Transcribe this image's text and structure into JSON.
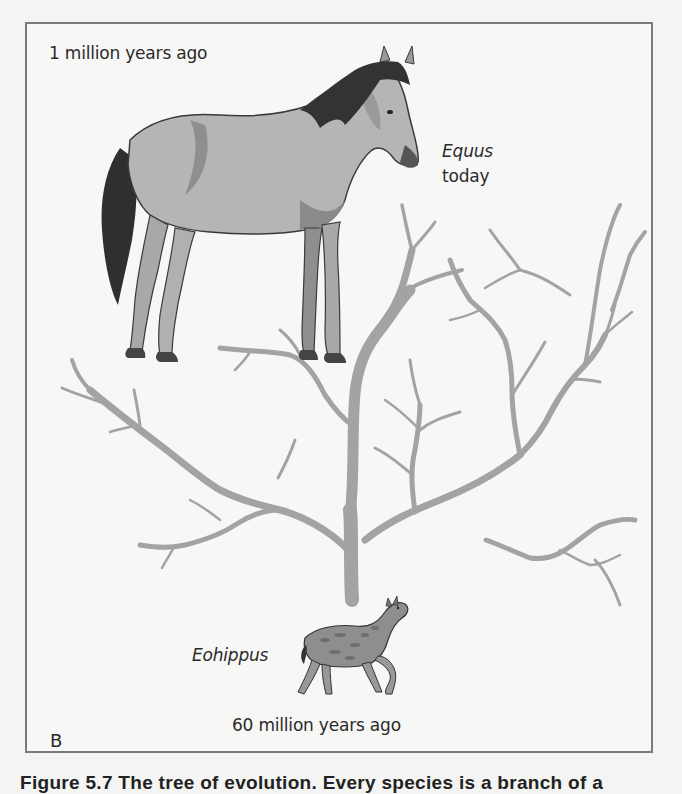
{
  "figure": {
    "panel_label": "B",
    "labels": {
      "top_time": "1 million years ago",
      "modern_genus": "Equus",
      "modern_time": "today",
      "ancestor_genus": "Eohippus",
      "bottom_time": "60 million years ago"
    },
    "caption_partial": "Figure 5.7  The tree of evolution. Every species is a branch of a"
  },
  "colors": {
    "frame": "#7a7a7a",
    "branches": "#a3a3a3",
    "horse_body": "#b4b4b4",
    "horse_shadow": "#8a8a8a",
    "mane": "#333333",
    "background": "#f7f7f5"
  }
}
